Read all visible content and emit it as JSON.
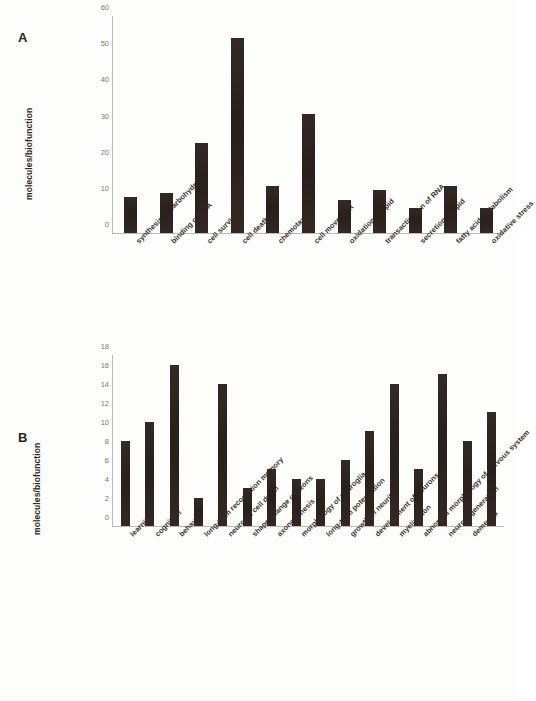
{
  "figure": {
    "background_color": "#fdfdfb",
    "bar_color": "#2e2420",
    "axis_color": "#bdb9b4"
  },
  "panel_a": {
    "letter": "A",
    "ylabel": "molecules/biofunction"
  },
  "panel_b": {
    "letter": "B",
    "ylabel": "molecules/biofunction"
  },
  "chart_data": [
    {
      "type": "bar",
      "panel": "A",
      "title": "",
      "xlabel": "",
      "ylabel": "molecules/biofunction",
      "ylim": [
        0,
        60
      ],
      "yticks": [
        0,
        10,
        20,
        30,
        40,
        50,
        60
      ],
      "grid": false,
      "legend": "none",
      "categories": [
        "synthesis of carbohydrate",
        "binding of DNA",
        "cell survival",
        "cell death",
        "chemotaxis",
        "cell movement",
        "oxidation of lipid",
        "transactivation of RNA",
        "secretion of lipid",
        "fatty acid metabolism",
        "oxidative stress"
      ],
      "values": [
        10,
        11,
        25,
        54,
        13,
        33,
        9,
        12,
        7,
        13,
        7
      ]
    },
    {
      "type": "bar",
      "panel": "B",
      "title": "",
      "xlabel": "",
      "ylabel": "molecules/biofunction",
      "ylim": [
        0,
        18
      ],
      "yticks": [
        0,
        2,
        4,
        6,
        8,
        10,
        12,
        14,
        16,
        18
      ],
      "grid": false,
      "legend": "none",
      "categories": [
        "learning",
        "cognition",
        "behavior",
        "long-term recognition memory",
        "neuronal cell death",
        "shape change of axons",
        "axonogenesis",
        "morphology of neuroglia",
        "long-term potentiation",
        "growth of neurites",
        "development of neurons",
        "myelination",
        "abnormal morphology of nervous system",
        "neurodegeneration",
        "dementia"
      ],
      "values": [
        9,
        11,
        17,
        3,
        15,
        4,
        6,
        5,
        5,
        7,
        10,
        15,
        6,
        16,
        9,
        12
      ]
    }
  ]
}
